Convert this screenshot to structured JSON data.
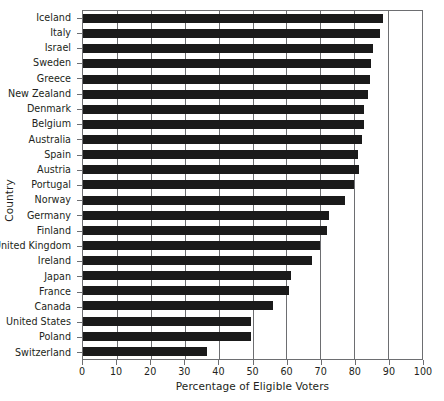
{
  "chart_data": {
    "type": "bar",
    "orientation": "horizontal",
    "title": "",
    "xlabel": "Percentage of Eligible Voters",
    "ylabel": "Country",
    "xlim": [
      0,
      100
    ],
    "xticks": [
      0,
      10,
      20,
      30,
      40,
      50,
      60,
      70,
      80,
      90,
      100
    ],
    "xtick_labels": [
      "0",
      "10",
      "20",
      "30",
      "40",
      "50",
      "60",
      "70",
      "80",
      "90",
      "100"
    ],
    "grid": true,
    "grid_axis": "x",
    "legend": null,
    "bar_color": "#1a1a1a",
    "axis_color": "#6d6e71",
    "categories": [
      "Iceland",
      "Italy",
      "Israel",
      "Sweden",
      "Greece",
      "New Zealand",
      "Denmark",
      "Belgium",
      "Australia",
      "Spain",
      "Austria",
      "Portugal",
      "Norway",
      "Germany",
      "Finland",
      "United Kingdom",
      "Ireland",
      "Japan",
      "France",
      "Canada",
      "United States",
      "Poland",
      "Switzerland"
    ],
    "values": [
      88.6,
      87.7,
      85.6,
      85.0,
      84.7,
      84.2,
      83.0,
      83.0,
      82.4,
      81.0,
      81.5,
      80.0,
      77.4,
      72.7,
      72.0,
      70.0,
      67.5,
      61.3,
      60.7,
      56.0,
      49.5,
      49.5,
      36.7
    ]
  }
}
